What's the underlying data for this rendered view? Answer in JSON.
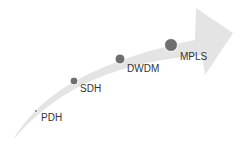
{
  "diagram": {
    "title": "",
    "arrow_color": "#e4e4e4",
    "dot_color": "#6e6e6e",
    "stages": [
      {
        "label": "PDH",
        "x": 36,
        "y": 111,
        "r": 1.5,
        "lx": 41,
        "ly": 113
      },
      {
        "label": "SDH",
        "x": 74,
        "y": 81,
        "r": 4,
        "lx": 80,
        "ly": 84
      },
      {
        "label": "DWDM",
        "x": 120,
        "y": 59,
        "r": 5,
        "lx": 127,
        "ly": 64
      },
      {
        "label": "MPLS",
        "x": 171,
        "y": 45,
        "r": 6.5,
        "lx": 180,
        "ly": 52
      }
    ]
  }
}
